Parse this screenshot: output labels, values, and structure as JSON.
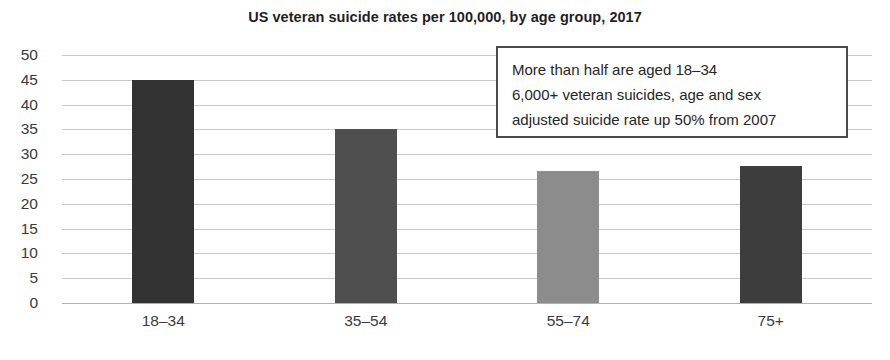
{
  "chart_data": {
    "type": "bar",
    "title": "US veteran suicide rates per 100,000, by age group, 2017",
    "xlabel": "",
    "ylabel": "",
    "categories": [
      "18–34",
      "35–54",
      "55–74",
      "75+"
    ],
    "values": [
      45,
      35,
      26.7,
      27.7
    ],
    "bar_colors": [
      "#333333",
      "#4f4f4f",
      "#8c8c8c",
      "#3d3d3d"
    ],
    "ylim": [
      0,
      50
    ],
    "ytick_step": 5,
    "yticks": [
      50,
      45,
      40,
      35,
      30,
      25,
      20,
      15,
      10,
      5,
      0
    ],
    "grid": true,
    "legend": "none",
    "gridline_color": "#c9c9c9",
    "annotations": [
      {
        "name": "callout",
        "lines": [
          "More than half are aged 18–34",
          "6,000+ veteran suicides, age and sex",
          "adjusted suicide rate up 50% from 2007"
        ],
        "border_color": "#4a4a4a",
        "background": "#ffffff"
      }
    ]
  }
}
